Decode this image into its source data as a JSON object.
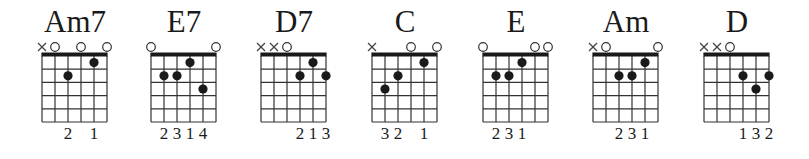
{
  "chart_data": {
    "type": "chord_diagrams",
    "strings": 6,
    "frets_shown": 5,
    "string_order": "low E (6) to high E (1), left to right",
    "chords": [
      {
        "name": "Am7",
        "strings": [
          "x",
          "o",
          2,
          "o",
          1,
          "o"
        ],
        "fingers": [
          "",
          "",
          2,
          "",
          1,
          ""
        ]
      },
      {
        "name": "E7",
        "strings": [
          "o",
          2,
          2,
          1,
          3,
          "o"
        ],
        "fingers": [
          "",
          2,
          3,
          1,
          4,
          ""
        ]
      },
      {
        "name": "D7",
        "strings": [
          "x",
          "x",
          "o",
          2,
          1,
          2
        ],
        "fingers": [
          "",
          "",
          "",
          2,
          1,
          3
        ]
      },
      {
        "name": "C",
        "strings": [
          "x",
          3,
          2,
          "o",
          1,
          "o"
        ],
        "fingers": [
          "",
          3,
          2,
          "",
          1,
          ""
        ]
      },
      {
        "name": "E",
        "strings": [
          "o",
          2,
          2,
          1,
          "o",
          "o"
        ],
        "fingers": [
          "",
          2,
          3,
          1,
          "",
          ""
        ]
      },
      {
        "name": "Am",
        "strings": [
          "x",
          "o",
          2,
          2,
          1,
          "o"
        ],
        "fingers": [
          "",
          "",
          2,
          3,
          1,
          ""
        ]
      },
      {
        "name": "D",
        "strings": [
          "x",
          "x",
          "o",
          2,
          3,
          2
        ],
        "fingers": [
          "",
          "",
          "",
          1,
          3,
          2
        ]
      }
    ]
  },
  "colors": {
    "ink": "#1a1a1a",
    "grid": "#333333",
    "background": "#ffffff"
  },
  "chords": {
    "0": {
      "name": "Am7"
    },
    "1": {
      "name": "E7"
    },
    "2": {
      "name": "D7"
    },
    "3": {
      "name": "C"
    },
    "4": {
      "name": "E"
    },
    "5": {
      "name": "Am"
    },
    "6": {
      "name": "D"
    }
  }
}
